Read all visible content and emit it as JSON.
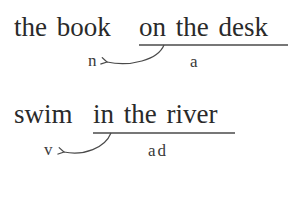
{
  "examples": [
    {
      "phrase": "the book on the desk",
      "head": "the book",
      "modifier": "on the desk",
      "head_label": "n",
      "modifier_label": "a"
    },
    {
      "phrase": "swim in the river",
      "head": "swim",
      "modifier": "in the river",
      "head_label": "v",
      "modifier_label": "ad"
    }
  ],
  "colors": {
    "text": "#2a2a2a",
    "line": "#4a4a4a",
    "background": "#ffffff"
  }
}
